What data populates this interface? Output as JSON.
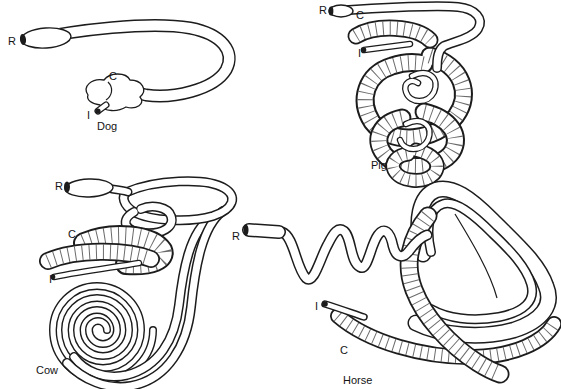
{
  "figure": {
    "description_colors": {
      "ink": "#1c1c1c",
      "paper": "#ffffff"
    }
  },
  "panels": {
    "dog": {
      "caption": "Dog",
      "markers": {
        "r": "R",
        "c": "C",
        "i": "I"
      }
    },
    "pig": {
      "caption": "Pig",
      "markers": {
        "r": "R",
        "c": "C",
        "i": "I"
      }
    },
    "cow": {
      "caption": "Cow",
      "markers": {
        "r": "R",
        "c": "C",
        "i": "I"
      }
    },
    "horse": {
      "caption": "Horse",
      "markers": {
        "r": "R",
        "c": "C",
        "i": "I"
      }
    }
  }
}
